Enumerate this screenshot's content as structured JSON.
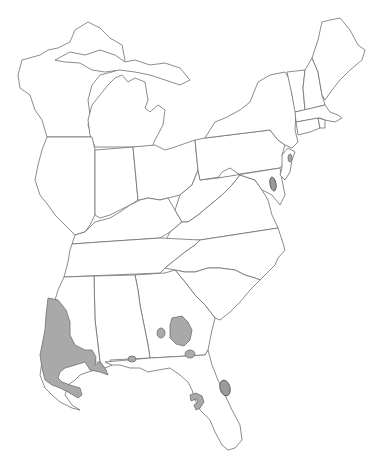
{
  "map": {
    "type": "species range map",
    "region": "Eastern United States",
    "colors": {
      "background": "#ffffff",
      "state_fill": "#ffffff",
      "state_border": "#6e6e6e",
      "range_fill": "#a9a9a9"
    },
    "states": [
      "Wisconsin",
      "Michigan",
      "Illinois",
      "Indiana",
      "Ohio",
      "Kentucky",
      "Tennessee",
      "Mississippi",
      "Alabama",
      "Georgia",
      "Florida",
      "South Carolina",
      "North Carolina",
      "Virginia",
      "West Virginia",
      "Maryland",
      "Delaware",
      "Pennsylvania",
      "New Jersey",
      "New York",
      "Vermont",
      "New Hampshire",
      "Maine",
      "Massachusetts",
      "Connecticut",
      "Rhode Island",
      "Louisiana"
    ],
    "range_areas": [
      {
        "name": "louisiana-mississippi-range",
        "description": "Large shaded area covering southeastern Louisiana and southwestern Mississippi"
      },
      {
        "name": "florida-panhandle-spot",
        "description": "Small shaded spot on western Florida panhandle coast"
      },
      {
        "name": "southwest-georgia-large",
        "description": "Large shaded patch in southwest Georgia"
      },
      {
        "name": "southwest-georgia-small",
        "description": "Small oval in southwest Georgia"
      },
      {
        "name": "georgia-florida-border",
        "description": "Small oval on Georgia-Florida border"
      },
      {
        "name": "east-florida-coast",
        "description": "Hatched oval on east-central Florida coast"
      },
      {
        "name": "west-florida-hook",
        "description": "Hook-shaped patch on west-central Florida"
      },
      {
        "name": "new-jersey-spot",
        "description": "Small oval in central New Jersey"
      },
      {
        "name": "delmarva-spot",
        "description": "Hatched oval on Delmarva peninsula"
      }
    ]
  }
}
